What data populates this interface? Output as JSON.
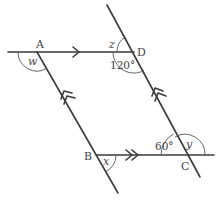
{
  "diagram": {
    "type": "parallelogram-angles",
    "colors": {
      "line": "#3a3a3a",
      "text": "#444444",
      "background": "#ffffff"
    },
    "vertices": {
      "A": {
        "label": "A"
      },
      "B": {
        "label": "B"
      },
      "C": {
        "label": "C"
      },
      "D": {
        "label": "D"
      }
    },
    "angles": {
      "w": {
        "label": "w",
        "at": "A"
      },
      "z": {
        "label": "z",
        "at": "D"
      },
      "d120": {
        "label": "120°",
        "at": "D"
      },
      "x": {
        "label": "x",
        "at": "B"
      },
      "d60": {
        "label": "60°",
        "at": "C"
      },
      "y": {
        "label": "y",
        "at": "C"
      }
    },
    "parallel_marks": {
      "AD_BC": "single arrow on AD, double arrow on BC",
      "AB_DC": "double arrowhead on AB and DC"
    }
  }
}
